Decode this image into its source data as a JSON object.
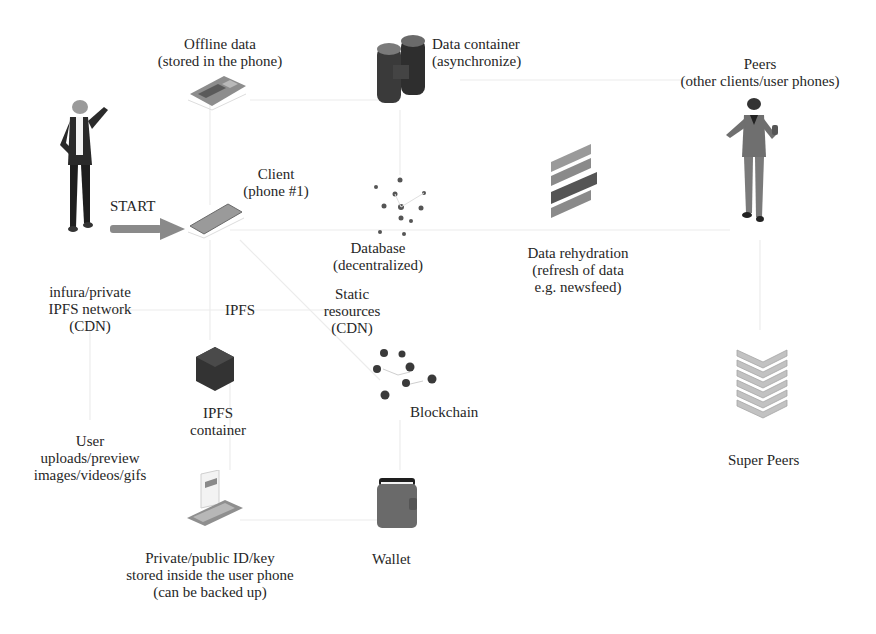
{
  "diagram": {
    "nodes": [
      {
        "id": "offline",
        "lines": [
          "Offline data",
          "(stored in the phone)"
        ],
        "icon": "circuit-board-icon"
      },
      {
        "id": "datacontainer",
        "lines": [
          "Data container",
          "(asynchronize)"
        ],
        "icon": "data-container-icon"
      },
      {
        "id": "peers",
        "lines": [
          "Peers",
          "(other clients/user phones)"
        ],
        "icon": "peer-person-icon"
      },
      {
        "id": "client",
        "lines": [
          "Client",
          "(phone #1)"
        ],
        "icon": "phone-icon"
      },
      {
        "id": "start",
        "lines": [
          "START"
        ],
        "icon": "start-arrow-icon"
      },
      {
        "id": "database",
        "lines": [
          "Database",
          "(decentralized)"
        ],
        "icon": "network-nodes-icon"
      },
      {
        "id": "rehydration",
        "lines": [
          "Data rehydration",
          "(refresh of data",
          "e.g. newsfeed)"
        ],
        "icon": "stacked-layers-icon"
      },
      {
        "id": "infura",
        "lines": [
          "infura/private",
          "IPFS network",
          "(CDN)"
        ]
      },
      {
        "id": "ipfs",
        "lines": [
          "IPFS"
        ]
      },
      {
        "id": "static",
        "lines": [
          "Static",
          "resources",
          "(CDN)"
        ]
      },
      {
        "id": "ipfscontainer",
        "lines": [
          "IPFS",
          "container"
        ],
        "icon": "cube-icon"
      },
      {
        "id": "blockchain",
        "lines": [
          "Blockchain"
        ],
        "icon": "blockchain-icon"
      },
      {
        "id": "superpeers",
        "lines": [
          "Super Peers"
        ],
        "icon": "server-stack-icon"
      },
      {
        "id": "uploads",
        "lines": [
          "User",
          "uploads/preview",
          "images/videos/gifs"
        ]
      },
      {
        "id": "privatekey",
        "lines": [
          "Private/public ID/key",
          "stored inside the user phone",
          "(can be backed up)"
        ],
        "icon": "phone-card-icon"
      },
      {
        "id": "wallet",
        "lines": [
          "Wallet"
        ],
        "icon": "wallet-icon"
      }
    ],
    "user_figure": "user-person-icon",
    "colors": {
      "dark": "#2b2b2b",
      "mid": "#7a7a7a",
      "light": "#b5b5b5",
      "line": "#ececec",
      "arrow": "#8a8a8a"
    }
  }
}
